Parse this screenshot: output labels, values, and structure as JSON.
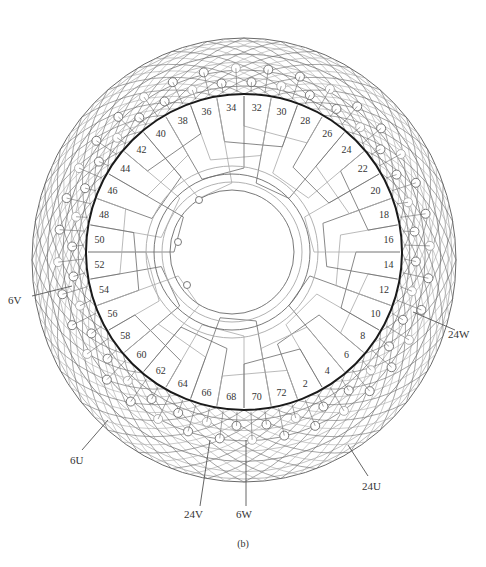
{
  "figure": {
    "caption": "(b)",
    "type": "72-slot stator winding connection diagram",
    "center": {
      "x": 244,
      "y": 252
    },
    "stator_ring_radius": 158,
    "inner_circle_radius": 62,
    "outer_envelope": {
      "rx": 212,
      "ry": 222
    },
    "colors": {
      "ring": "#1a1a1a",
      "wire": "#6a6a6a",
      "wire_light": "#a8a8a8",
      "text": "#333333"
    }
  },
  "slot_labels": [
    "2",
    "4",
    "6",
    "8",
    "10",
    "12",
    "14",
    "16",
    "18",
    "20",
    "22",
    "24",
    "26",
    "28",
    "30",
    "32",
    "34",
    "36",
    "38",
    "40",
    "42",
    "44",
    "46",
    "48",
    "50",
    "52",
    "54",
    "56",
    "58",
    "60",
    "62",
    "64",
    "66",
    "68",
    "70",
    "72"
  ],
  "terminals": [
    {
      "label": "6V",
      "x": 8,
      "y": 300,
      "lx1": 32,
      "ly1": 296,
      "lx2": 72,
      "ly2": 286
    },
    {
      "label": "24W",
      "x": 448,
      "y": 334,
      "lx1": 455,
      "ly1": 330,
      "lx2": 413,
      "ly2": 312
    },
    {
      "label": "6U",
      "x": 70,
      "y": 460,
      "lx1": 82,
      "ly1": 450,
      "lx2": 108,
      "ly2": 420
    },
    {
      "label": "24U",
      "x": 362,
      "y": 486,
      "lx1": 368,
      "ly1": 476,
      "lx2": 348,
      "ly2": 445
    },
    {
      "label": "24V",
      "x": 184,
      "y": 514,
      "lx1": 200,
      "ly1": 506,
      "lx2": 210,
      "ly2": 440
    },
    {
      "label": "6W",
      "x": 236,
      "y": 514,
      "lx1": 246,
      "ly1": 506,
      "lx2": 246,
      "ly2": 440
    }
  ]
}
